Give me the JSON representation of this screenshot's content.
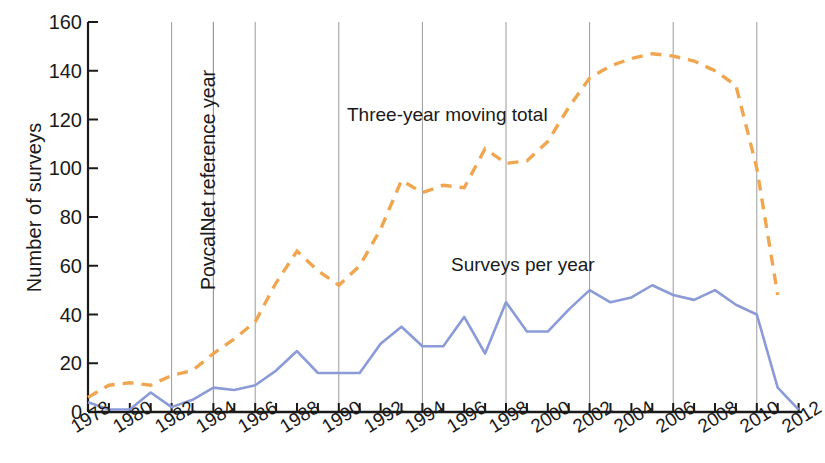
{
  "chart_data": {
    "type": "line",
    "title": "",
    "xlabel": "",
    "ylabel": "Number of surveys",
    "ylim": [
      0,
      160
    ],
    "ytick_values": [
      0,
      20,
      40,
      60,
      80,
      100,
      120,
      140,
      160
    ],
    "xlim": [
      1978,
      2012
    ],
    "xtick_labels": [
      "1978",
      "1980",
      "1982",
      "1984",
      "1986",
      "1988",
      "1990",
      "1992",
      "1994",
      "1996",
      "1998",
      "2000",
      "2002",
      "2004",
      "2006",
      "2008",
      "2010",
      "2012"
    ],
    "grid": "vertical-every-4-years",
    "legend_position": "inline-annotations",
    "x": [
      1978,
      1979,
      1980,
      1981,
      1982,
      1983,
      1984,
      1985,
      1986,
      1987,
      1988,
      1989,
      1990,
      1991,
      1992,
      1993,
      1994,
      1995,
      1996,
      1997,
      1998,
      1999,
      2000,
      2001,
      2002,
      2003,
      2004,
      2005,
      2006,
      2007,
      2008,
      2009,
      2010,
      2011,
      2012
    ],
    "series": [
      {
        "name": "Surveys per year",
        "color": "#8a9bd8",
        "style": "solid",
        "values": [
          4,
          1,
          1,
          8,
          2,
          5,
          10,
          9,
          11,
          17,
          25,
          16,
          16,
          16,
          28,
          35,
          27,
          27,
          39,
          24,
          45,
          33,
          33,
          42,
          50,
          45,
          47,
          52,
          48,
          46,
          50,
          44,
          40,
          10,
          1
        ]
      },
      {
        "name": "Three-year moving total",
        "color": "#f0a650",
        "style": "dashed",
        "values": [
          6,
          11,
          12,
          11,
          15,
          17,
          24,
          30,
          37,
          53,
          66,
          58,
          52,
          60,
          75,
          95,
          90,
          93,
          92,
          108,
          102,
          103,
          111,
          125,
          137,
          142,
          145,
          147,
          146,
          144,
          140,
          134,
          100,
          48,
          null
        ]
      }
    ],
    "annotations": [
      {
        "name": "povcalnet-reference-year",
        "text": "PovcalNet reference year",
        "orientation": "vertical",
        "x_year": 1984
      },
      {
        "name": "three-year-moving-total-label",
        "text": "Three-year moving total",
        "orientation": "horizontal"
      },
      {
        "name": "surveys-per-year-label",
        "text": "Surveys per year",
        "orientation": "horizontal"
      }
    ],
    "gridline_years": [
      1982,
      1984,
      1988,
      1992,
      1996,
      2000,
      2004,
      2008,
      2011
    ]
  },
  "axis": {
    "y_label": "Number of surveys",
    "y_ticks": [
      "160",
      "140",
      "120",
      "100",
      "80",
      "60",
      "40",
      "20",
      "0"
    ],
    "x_ticks": [
      "1978",
      "1980",
      "1982",
      "1984",
      "1986",
      "1988",
      "1990",
      "1992",
      "1994",
      "1996",
      "1998",
      "2000",
      "2002",
      "2004",
      "2006",
      "2008",
      "2010",
      "2012"
    ]
  },
  "labels": {
    "povcalnet": "PovcalNet reference year",
    "moving_total": "Three-year moving total",
    "surveys_per_year": "Surveys per year"
  },
  "colors": {
    "blue_series": "#8a9bd8",
    "orange_series": "#f0a650",
    "axis": "#1a1a1a",
    "gridline": "#9a9a9a"
  }
}
